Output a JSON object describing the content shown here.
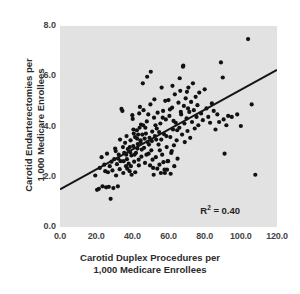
{
  "chart_data": {
    "type": "scatter",
    "title": "",
    "xlabel": "Carotid Duplex Procedures per\n1,000 Medicare Enrollees",
    "xlabel_line1": "Carotid Duplex Procedures per",
    "xlabel_line2": "1,000 Medicare Enrollees",
    "ylabel": "Carotid Endarterectomies per\n1,000 Medicare Enrollees",
    "ylabel_line1": "Carotid Endarterectomies per",
    "ylabel_line2": "1,000 Medicare Enrollees",
    "xlim": [
      0.0,
      120.0
    ],
    "ylim": [
      0.0,
      8.0
    ],
    "xticks": [
      "0.0",
      "20.0",
      "40.0",
      "60.0",
      "80.0",
      "100.0",
      "120.0"
    ],
    "xtick_values": [
      0,
      20,
      40,
      60,
      80,
      100,
      120
    ],
    "yticks": [
      "0.0",
      "2.0",
      "4.0",
      "6.0",
      "8.0"
    ],
    "ytick_values": [
      0,
      2,
      4,
      6,
      8
    ],
    "grid": false,
    "legend": "none",
    "plot_background": "#e2e2e2",
    "marker_color": "#111111",
    "marker_size_px": 4.2,
    "annotations": [
      {
        "name": "r-squared",
        "text_prefix": "R",
        "text_sup": "2",
        "text_suffix": " = 0.40",
        "x": 103,
        "y": 0.62
      }
    ],
    "trendline": {
      "name": "linear-regression-line",
      "color": "#151515",
      "width_px": 2.0,
      "x0": 0.0,
      "y0": 1.5,
      "x1": 120.0,
      "y1": 6.25
    },
    "points": [
      [
        19.5,
        2.05
      ],
      [
        20.5,
        1.48
      ],
      [
        21.5,
        1.52
      ],
      [
        22.0,
        2.35
      ],
      [
        23.0,
        2.78
      ],
      [
        23.5,
        1.62
      ],
      [
        24.5,
        2.48
      ],
      [
        25.0,
        2.22
      ],
      [
        25.5,
        1.58
      ],
      [
        26.0,
        2.92
      ],
      [
        26.5,
        2.18
      ],
      [
        27.0,
        1.6
      ],
      [
        27.5,
        2.42
      ],
      [
        28.0,
        1.12
      ],
      [
        28.5,
        2.6
      ],
      [
        29.0,
        2.25
      ],
      [
        29.5,
        1.55
      ],
      [
        30.0,
        2.7
      ],
      [
        30.5,
        3.12
      ],
      [
        31.0,
        2.05
      ],
      [
        31.5,
        2.5
      ],
      [
        32.0,
        1.62
      ],
      [
        32.5,
        2.88
      ],
      [
        33.0,
        2.3
      ],
      [
        33.5,
        2.62
      ],
      [
        34.0,
        4.7
      ],
      [
        34.5,
        4.62
      ],
      [
        35.0,
        2.15
      ],
      [
        35.5,
        2.95
      ],
      [
        36.0,
        3.35
      ],
      [
        36.5,
        2.42
      ],
      [
        37.0,
        2.7
      ],
      [
        37.5,
        3.1
      ],
      [
        38.0,
        2.52
      ],
      [
        38.5,
        2.22
      ],
      [
        39.0,
        3.45
      ],
      [
        39.5,
        2.85
      ],
      [
        40.0,
        4.45
      ],
      [
        40.2,
        4.3
      ],
      [
        40.5,
        3.22
      ],
      [
        41.0,
        2.6
      ],
      [
        41.5,
        3.58
      ],
      [
        42.0,
        2.95
      ],
      [
        42.5,
        3.85
      ],
      [
        43.0,
        3.3
      ],
      [
        43.5,
        2.68
      ],
      [
        44.0,
        3.95
      ],
      [
        44.5,
        3.45
      ],
      [
        45.0,
        2.8
      ],
      [
        45.5,
        3.68
      ],
      [
        46.0,
        4.05
      ],
      [
        46.5,
        3.15
      ],
      [
        47.0,
        2.55
      ],
      [
        47.5,
        3.72
      ],
      [
        48.0,
        4.2
      ],
      [
        48.5,
        3.38
      ],
      [
        49.0,
        2.92
      ],
      [
        49.5,
        3.55
      ],
      [
        50.0,
        4.88
      ],
      [
        50.2,
        6.18
      ],
      [
        50.5,
        3.05
      ],
      [
        51.0,
        3.8
      ],
      [
        51.5,
        2.35
      ],
      [
        52.0,
        4.35
      ],
      [
        52.5,
        3.62
      ],
      [
        53.0,
        2.78
      ],
      [
        53.5,
        3.92
      ],
      [
        54.0,
        4.55
      ],
      [
        54.5,
        3.28
      ],
      [
        55.0,
        2.48
      ],
      [
        55.5,
        4.12
      ],
      [
        56.0,
        3.48
      ],
      [
        56.5,
        2.88
      ],
      [
        57.0,
        4.62
      ],
      [
        57.5,
        3.7
      ],
      [
        58.0,
        2.15
      ],
      [
        58.5,
        4.28
      ],
      [
        59.0,
        3.18
      ],
      [
        59.5,
        2.62
      ],
      [
        60.0,
        5.05
      ],
      [
        60.5,
        4.42
      ],
      [
        61.0,
        3.58
      ],
      [
        61.5,
        2.95
      ],
      [
        62.0,
        4.75
      ],
      [
        62.5,
        3.88
      ],
      [
        63.0,
        3.25
      ],
      [
        63.5,
        5.28
      ],
      [
        64.0,
        4.15
      ],
      [
        64.5,
        3.45
      ],
      [
        65.0,
        2.72
      ],
      [
        65.5,
        4.95
      ],
      [
        66.0,
        3.95
      ],
      [
        66.5,
        5.42
      ],
      [
        67.0,
        4.48
      ],
      [
        67.5,
        3.68
      ],
      [
        68.0,
        6.38
      ],
      [
        68.2,
        6.42
      ],
      [
        68.5,
        4.82
      ],
      [
        69.0,
        3.38
      ],
      [
        69.5,
        5.12
      ],
      [
        70.0,
        4.32
      ],
      [
        70.5,
        3.82
      ],
      [
        71.0,
        5.55
      ],
      [
        71.5,
        4.58
      ],
      [
        72.0,
        3.55
      ],
      [
        72.5,
        4.98
      ],
      [
        73.0,
        4.18
      ],
      [
        73.5,
        5.72
      ],
      [
        74.0,
        4.65
      ],
      [
        74.5,
        3.92
      ],
      [
        75.0,
        5.18
      ],
      [
        75.5,
        4.38
      ],
      [
        76.0,
        4.85
      ],
      [
        76.5,
        4.05
      ],
      [
        77.0,
        5.35
      ],
      [
        78.0,
        4.52
      ],
      [
        79.0,
        4.25
      ],
      [
        80.0,
        5.48
      ],
      [
        81.0,
        4.72
      ],
      [
        82.0,
        4.38
      ],
      [
        83.0,
        4.15
      ],
      [
        84.0,
        4.92
      ],
      [
        85.0,
        4.62
      ],
      [
        86.0,
        3.88
      ],
      [
        87.0,
        4.48
      ],
      [
        88.0,
        4.18
      ],
      [
        89.0,
        6.55
      ],
      [
        90.0,
        5.95
      ],
      [
        90.5,
        4.28
      ],
      [
        91.0,
        2.92
      ],
      [
        92.0,
        4.05
      ],
      [
        93.0,
        4.42
      ],
      [
        95.0,
        4.38
      ],
      [
        98.0,
        4.48
      ],
      [
        100.0,
        4.02
      ],
      [
        104.0,
        7.48
      ],
      [
        106.0,
        4.88
      ],
      [
        108.0,
        2.08
      ],
      [
        30.8,
        3.02
      ],
      [
        32.2,
        2.72
      ],
      [
        34.8,
        3.18
      ],
      [
        36.8,
        3.62
      ],
      [
        38.8,
        2.98
      ],
      [
        40.8,
        3.72
      ],
      [
        42.8,
        3.12
      ],
      [
        44.8,
        4.08
      ],
      [
        46.8,
        3.52
      ],
      [
        48.8,
        4.48
      ],
      [
        50.8,
        3.42
      ],
      [
        52.8,
        4.05
      ],
      [
        54.8,
        3.78
      ],
      [
        56.8,
        4.35
      ],
      [
        58.8,
        3.62
      ],
      [
        60.8,
        4.68
      ],
      [
        62.8,
        4.22
      ],
      [
        64.8,
        3.85
      ],
      [
        66.8,
        4.58
      ],
      [
        68.8,
        4.12
      ],
      [
        70.8,
        4.72
      ],
      [
        41.2,
        2.88
      ],
      [
        43.2,
        3.68
      ],
      [
        45.2,
        3.08
      ],
      [
        47.2,
        3.95
      ],
      [
        49.2,
        3.28
      ],
      [
        51.2,
        2.68
      ],
      [
        53.2,
        3.48
      ],
      [
        55.2,
        3.05
      ],
      [
        57.2,
        2.58
      ],
      [
        59.2,
        2.28
      ],
      [
        61.2,
        2.12
      ],
      [
        63.2,
        2.42
      ],
      [
        39.2,
        2.42
      ],
      [
        37.2,
        2.32
      ],
      [
        35.2,
        2.62
      ],
      [
        33.2,
        3.48
      ],
      [
        44.2,
        4.78
      ],
      [
        46.2,
        4.65
      ],
      [
        52.2,
        5.08
      ],
      [
        56.2,
        5.55
      ],
      [
        58.2,
        5.02
      ],
      [
        62.2,
        5.62
      ],
      [
        66.2,
        5.92
      ],
      [
        70.2,
        5.38
      ],
      [
        48.2,
        5.98
      ],
      [
        45.8,
        5.72
      ],
      [
        43.8,
        4.52
      ],
      [
        47.8,
        2.88
      ],
      [
        49.8,
        2.45
      ],
      [
        51.8,
        2.08
      ],
      [
        55.8,
        2.15
      ],
      [
        57.8,
        2.28
      ],
      [
        59.8,
        2.62
      ],
      [
        61.8,
        3.02
      ],
      [
        53.8,
        2.32
      ],
      [
        44.6,
        3.38
      ],
      [
        42.6,
        3.52
      ],
      [
        40.6,
        3.88
      ],
      [
        38.6,
        3.18
      ],
      [
        36.6,
        2.88
      ],
      [
        43.6,
        2.45
      ],
      [
        41.6,
        2.18
      ],
      [
        39.6,
        2.08
      ]
    ]
  }
}
